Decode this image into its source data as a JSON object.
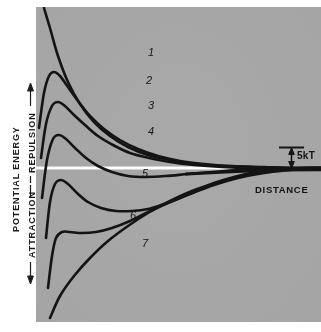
{
  "figure": {
    "domain": "chart",
    "background_color": "#ffffff",
    "panel_color": "#a9a9a9",
    "curve_color": "#141414",
    "zero_line_color": "#ffffff"
  },
  "axes": {
    "y_outer_label": "POTENTIAL  ENERGY",
    "y_upper_label": "REPULSION",
    "y_lower_label": "ATTRACTION",
    "x_label": "DISTANCE",
    "up_arrow_icon": "arrow-up-icon",
    "down_arrow_icon": "arrow-down-icon"
  },
  "annotations": {
    "energy_scale": "5kT",
    "energy_scale_icon": "double-arrow-vertical-icon"
  },
  "chart_data": {
    "type": "line",
    "title": "",
    "subtitle": "",
    "xlabel": "DISTANCE",
    "ylabel": "POTENTIAL ENERGY",
    "ylabel_positive": "REPULSION",
    "ylabel_negative": "ATTRACTION",
    "xlim": [
      0,
      285
    ],
    "ylim": [
      -150,
      162
    ],
    "grid": false,
    "legend": "inline-curve-numbers",
    "axis_ticks": false,
    "zero_line": 0,
    "scale_bar": {
      "label": "5kT",
      "value": 5,
      "units": "kT",
      "x": 258,
      "y_top": 0,
      "y_bottom": 22
    },
    "series": [
      {
        "name": "1",
        "label": "1",
        "label_x": 112,
        "label_y": 115,
        "description": "Strong repulsion, no maximum within range; monotonic decay from high energy",
        "points": [
          [
            8,
            160
          ],
          [
            14,
            140
          ],
          [
            22,
            112
          ],
          [
            32,
            86
          ],
          [
            44,
            64
          ],
          [
            58,
            46
          ],
          [
            74,
            32
          ],
          [
            92,
            21
          ],
          [
            112,
            13
          ],
          [
            134,
            8
          ],
          [
            158,
            4
          ],
          [
            186,
            2
          ],
          [
            214,
            1
          ],
          [
            246,
            0
          ],
          [
            285,
            0
          ]
        ]
      },
      {
        "name": "2",
        "label": "2",
        "label_x": 110,
        "label_y": 87,
        "description": "High repulsive maximum then decay to zero",
        "points": [
          [
            3,
            40
          ],
          [
            8,
            75
          ],
          [
            13,
            92
          ],
          [
            18,
            96
          ],
          [
            24,
            92
          ],
          [
            32,
            81
          ],
          [
            42,
            67
          ],
          [
            54,
            52
          ],
          [
            68,
            39
          ],
          [
            84,
            28
          ],
          [
            102,
            19
          ],
          [
            122,
            12
          ],
          [
            144,
            7
          ],
          [
            168,
            4
          ],
          [
            196,
            2
          ],
          [
            228,
            1
          ],
          [
            260,
            0
          ],
          [
            285,
            0
          ]
        ]
      },
      {
        "name": "3",
        "label": "3",
        "label_x": 112,
        "label_y": 62,
        "description": "Moderate repulsive maximum, decays to zero",
        "points": [
          [
            5,
            10
          ],
          [
            10,
            44
          ],
          [
            16,
            62
          ],
          [
            22,
            66
          ],
          [
            29,
            62
          ],
          [
            38,
            53
          ],
          [
            49,
            43
          ],
          [
            62,
            32
          ],
          [
            77,
            23
          ],
          [
            94,
            15
          ],
          [
            113,
            10
          ],
          [
            134,
            6
          ],
          [
            158,
            3
          ],
          [
            186,
            1
          ],
          [
            216,
            0
          ],
          [
            250,
            0
          ],
          [
            285,
            0
          ]
        ]
      },
      {
        "name": "4",
        "label": "4",
        "label_x": 112,
        "label_y": 36,
        "description": "Low repulsive maximum just above zero; shallow secondary minimum then to zero",
        "points": [
          [
            6,
            -30
          ],
          [
            11,
            8
          ],
          [
            17,
            29
          ],
          [
            23,
            33
          ],
          [
            30,
            29
          ],
          [
            39,
            20
          ],
          [
            50,
            10
          ],
          [
            62,
            2
          ],
          [
            76,
            -4
          ],
          [
            92,
            -8
          ],
          [
            110,
            -9
          ],
          [
            130,
            -8
          ],
          [
            152,
            -6
          ],
          [
            176,
            -4
          ],
          [
            202,
            -2
          ],
          [
            230,
            -1
          ],
          [
            258,
            0
          ],
          [
            285,
            0
          ]
        ]
      },
      {
        "name": "5",
        "label": "5",
        "label_x": 106,
        "label_y": -6,
        "description": "Maximum below zero; pronounced secondary minimum, then rises to zero",
        "points": [
          [
            10,
            -70
          ],
          [
            14,
            -34
          ],
          [
            19,
            -16
          ],
          [
            25,
            -12
          ],
          [
            32,
            -16
          ],
          [
            41,
            -25
          ],
          [
            52,
            -34
          ],
          [
            65,
            -40
          ],
          [
            80,
            -43
          ],
          [
            96,
            -43
          ],
          [
            112,
            -41
          ],
          [
            128,
            -36
          ],
          [
            144,
            -30
          ],
          [
            160,
            -23
          ],
          [
            178,
            -15
          ],
          [
            198,
            -9
          ],
          [
            220,
            -4
          ],
          [
            248,
            -1
          ],
          [
            272,
            0
          ],
          [
            285,
            0
          ]
        ]
      },
      {
        "name": "6",
        "label": "6",
        "label_x": 94,
        "label_y": -48,
        "description": "Shallow inflection well below zero, then steady rise to zero",
        "points": [
          [
            12,
            -120
          ],
          [
            16,
            -88
          ],
          [
            20,
            -70
          ],
          [
            26,
            -64
          ],
          [
            34,
            -64
          ],
          [
            46,
            -65
          ],
          [
            60,
            -64
          ],
          [
            76,
            -60
          ],
          [
            94,
            -53
          ],
          [
            112,
            -44
          ],
          [
            132,
            -35
          ],
          [
            154,
            -26
          ],
          [
            178,
            -17
          ],
          [
            202,
            -10
          ],
          [
            228,
            -5
          ],
          [
            254,
            -2
          ],
          [
            275,
            0
          ],
          [
            285,
            0
          ]
        ]
      },
      {
        "name": "7",
        "label": "7",
        "label_x": 106,
        "label_y": -76,
        "description": "Purely attractive, no maximum; monotonic rise from deep attraction to zero",
        "points": [
          [
            14,
            -150
          ],
          [
            24,
            -128
          ],
          [
            38,
            -108
          ],
          [
            54,
            -90
          ],
          [
            72,
            -73
          ],
          [
            92,
            -58
          ],
          [
            112,
            -45
          ],
          [
            134,
            -33
          ],
          [
            156,
            -23
          ],
          [
            180,
            -15
          ],
          [
            204,
            -9
          ],
          [
            228,
            -4
          ],
          [
            252,
            -1
          ],
          [
            272,
            0
          ],
          [
            285,
            0
          ]
        ]
      }
    ]
  },
  "curve_labels": [
    {
      "text": "1"
    },
    {
      "text": "2"
    },
    {
      "text": "3"
    },
    {
      "text": "4"
    },
    {
      "text": "5"
    },
    {
      "text": "6"
    },
    {
      "text": "7"
    }
  ]
}
